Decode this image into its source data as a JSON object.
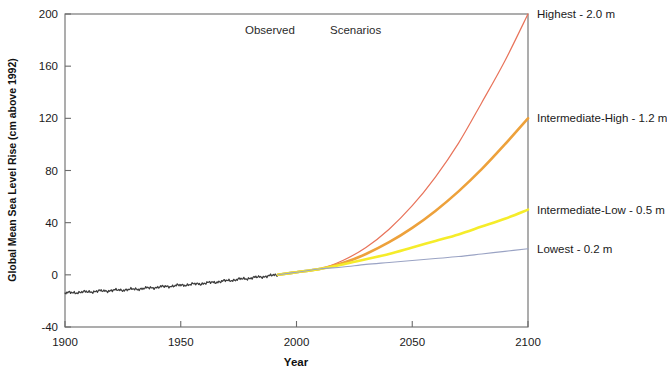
{
  "chart_data": {
    "type": "line",
    "title": "",
    "xlabel": "Year",
    "ylabel": "Global Mean Sea Level Rise (cm above 1992)",
    "xlim": [
      1900,
      2100
    ],
    "ylim": [
      -40,
      200
    ],
    "xticks": [
      "1900",
      "1950",
      "2000",
      "2050",
      "2100"
    ],
    "yticks": [
      "200",
      "160",
      "120",
      "80",
      "40",
      "0",
      "-40"
    ],
    "grid": false,
    "legend_position": "right-inline-labels",
    "annotations": [
      {
        "text": "Observed",
        "x": 1975,
        "y": 193
      },
      {
        "text": "Scenarios",
        "x": 2012,
        "y": 193
      }
    ],
    "x": [
      1900,
      1910,
      1920,
      1930,
      1940,
      1950,
      1960,
      1970,
      1980,
      1992,
      2000,
      2010,
      2020,
      2030,
      2040,
      2050,
      2060,
      2070,
      2080,
      2090,
      2100
    ],
    "series": [
      {
        "name": "Observed",
        "label": "Observed",
        "color": "#3d3d3d",
        "width": 1.25,
        "x": [
          1900,
          1910,
          1920,
          1930,
          1940,
          1950,
          1960,
          1970,
          1980,
          1992
        ],
        "values": [
          -14.0,
          -13.0,
          -12.0,
          -11.0,
          -9.5,
          -8.0,
          -6.5,
          -4.5,
          -2.5,
          0.0
        ]
      },
      {
        "name": "Transition",
        "label": "",
        "color": "#a8d8ea",
        "width": 2.6,
        "x": [
          1992,
          2000,
          2010
        ],
        "values": [
          0.0,
          2.0,
          4.5
        ]
      },
      {
        "name": "Highest",
        "label": "Highest - 2.0 m",
        "color": "#e8735a",
        "width": 1.2,
        "values": [
          null,
          null,
          null,
          null,
          null,
          null,
          null,
          null,
          null,
          0,
          2,
          4.5,
          11,
          21,
          35,
          53,
          75,
          101,
          132,
          164,
          200
        ]
      },
      {
        "name": "Intermediate-High",
        "label": "Intermediate-High - 1.2 m",
        "color": "#eda13b",
        "width": 2.6,
        "values": [
          null,
          null,
          null,
          null,
          null,
          null,
          null,
          null,
          null,
          0,
          2,
          4.5,
          9,
          16,
          25,
          36,
          49,
          64,
          81,
          100,
          120
        ]
      },
      {
        "name": "Intermediate-Low",
        "label": "Intermediate-Low - 0.5 m",
        "color": "#f5ec2a",
        "width": 2.6,
        "values": [
          null,
          null,
          null,
          null,
          null,
          null,
          null,
          null,
          null,
          0,
          2,
          4.5,
          8,
          12,
          16,
          21,
          26,
          31,
          37,
          43,
          50
        ]
      },
      {
        "name": "Lowest",
        "label": "Lowest - 0.2 m",
        "color": "#9aa3c4",
        "width": 1.1,
        "values": [
          null,
          null,
          null,
          null,
          null,
          null,
          null,
          null,
          null,
          0,
          2,
          4.5,
          6,
          8,
          9.5,
          11,
          12.5,
          14,
          16,
          18,
          20
        ]
      }
    ]
  }
}
